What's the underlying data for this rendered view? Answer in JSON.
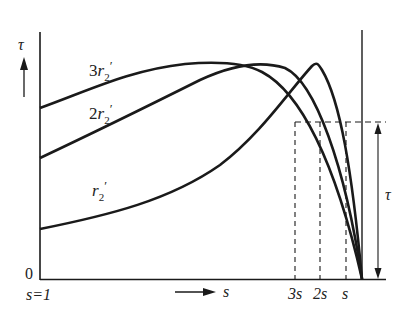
{
  "diagram": {
    "y_axis": {
      "symbol": "τ",
      "origin_label": "0"
    },
    "x_axis": {
      "start_label": "s=1",
      "direction_label": "s"
    },
    "curves": [
      {
        "id": "r3",
        "label_prefix": "3",
        "label_main": "r",
        "label_sub": "2",
        "label_prime": "′"
      },
      {
        "id": "r2",
        "label_prefix": "2",
        "label_main": "r",
        "label_sub": "2",
        "label_prime": "′"
      },
      {
        "id": "r1",
        "label_prefix": "",
        "label_main": "r",
        "label_sub": "2",
        "label_prime": "′"
      }
    ],
    "slip_markers": [
      {
        "label": "3s"
      },
      {
        "label": "2s"
      },
      {
        "label": "s"
      }
    ],
    "load_torque_label": "τ",
    "colors": {
      "line": "#1a1a1a",
      "text": "#222222",
      "background": "#ffffff"
    }
  }
}
